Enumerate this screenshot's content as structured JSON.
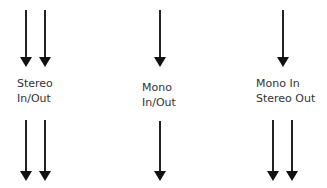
{
  "modes": [
    {
      "id": "stereo",
      "label_line1": "Stereo",
      "label_line2": "In/Out",
      "inputs": 2,
      "outputs": 2
    },
    {
      "id": "mono",
      "label_line1": "Mono",
      "label_line2": "In/Out",
      "inputs": 1,
      "outputs": 1
    },
    {
      "id": "mono-stereo",
      "label_line1": "Mono In",
      "label_line2": "Stereo Out",
      "inputs": 1,
      "outputs": 2
    }
  ],
  "colors": {
    "arrow": "#111111",
    "text": "#333333",
    "background": "#ffffff"
  }
}
